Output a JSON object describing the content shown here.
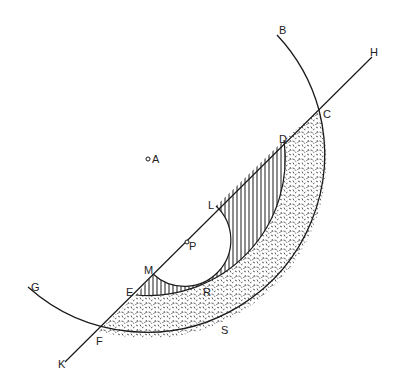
{
  "diagram": {
    "type": "geometry-figure",
    "colors": {
      "stroke": "#1a1a1a",
      "background": "#ffffff",
      "stipple": "#333333"
    },
    "labels": {
      "A": "A",
      "B": "B",
      "C": "C",
      "D": "D",
      "E": "E",
      "F": "F",
      "G": "G",
      "H": "H",
      "K": "K",
      "L": "L",
      "M": "M",
      "P": "P",
      "R": "R",
      "S": "S"
    },
    "points": {
      "A": [
        148,
        159
      ],
      "B": [
        277,
        35
      ],
      "C": [
        319,
        110
      ],
      "D": [
        284,
        140
      ],
      "E": [
        136,
        295
      ],
      "F": [
        98,
        331
      ],
      "G": [
        28,
        287
      ],
      "H": [
        372,
        57
      ],
      "K": [
        65,
        362
      ],
      "L": [
        216,
        206
      ],
      "M": [
        153,
        274
      ],
      "P": [
        188,
        243
      ]
    },
    "circles": [
      {
        "name": "outer-arc",
        "center": "A",
        "radius": 178,
        "from": "G",
        "to": "B"
      },
      {
        "name": "inner-arc",
        "center": "A",
        "radius": 137,
        "from": "E",
        "to": "D"
      },
      {
        "name": "small-semicircle",
        "center": "P",
        "radius": 46,
        "from": "M",
        "to": "L"
      }
    ],
    "lines": [
      {
        "name": "secant-KH",
        "from": "K",
        "to": "H"
      }
    ],
    "regions": [
      {
        "name": "ring-region",
        "fill": "stipple",
        "bounds": "F-C outer arc, E-D inner arc, chord"
      },
      {
        "name": "crescent-region",
        "fill": "vertical-hatch",
        "bounds": "E-D inner arc, M-L semicircle, chord"
      }
    ]
  }
}
